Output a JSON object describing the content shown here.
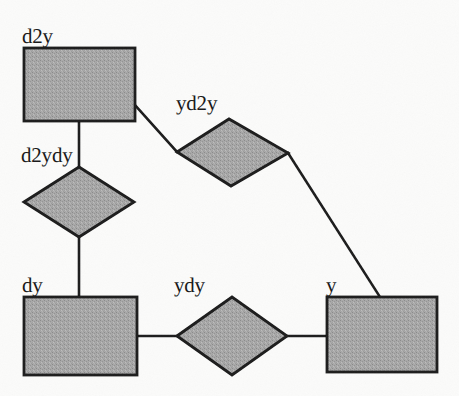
{
  "diagram": {
    "type": "er-diagram",
    "canvas": {
      "width": 459,
      "height": 396
    },
    "style": {
      "fill_color": "#a3a3a3",
      "stroke_color": "#1a1a1a",
      "background_color": "#fbfbfa",
      "label_color": "#171717",
      "stroke_width": 2.6
    },
    "entities": [
      {
        "id": "d2y",
        "label": "d2y",
        "shape": "rectangle",
        "x": 24,
        "y": 48,
        "width": 111,
        "height": 73,
        "label_x": 22,
        "label_y": 26
      },
      {
        "id": "dy",
        "label": "dy",
        "shape": "rectangle",
        "x": 24,
        "y": 297,
        "width": 113,
        "height": 78,
        "label_x": 22,
        "label_y": 275
      },
      {
        "id": "y",
        "label": "y",
        "shape": "rectangle",
        "x": 327,
        "y": 297,
        "width": 110,
        "height": 75,
        "label_x": 326,
        "label_y": 275
      }
    ],
    "relationships": [
      {
        "id": "d2ydy",
        "label": "d2ydy",
        "shape": "diamond",
        "cx": 79,
        "cy": 202,
        "rx": 55,
        "ry": 35,
        "rotated": false,
        "label_x": 21,
        "label_y": 145
      },
      {
        "id": "ydy",
        "label": "ydy",
        "shape": "diamond",
        "cx": 232,
        "cy": 336,
        "rx": 55,
        "ry": 39,
        "rotated": false,
        "label_x": 174,
        "label_y": 275
      },
      {
        "id": "yd2y",
        "label": "yd2y",
        "shape": "diamond",
        "cx": 232,
        "cy": 152,
        "rx": 56,
        "ry": 34,
        "rotated": true,
        "vertices": "177,152 229,119 288,153 231,186",
        "label_x": 176,
        "label_y": 93
      }
    ],
    "edges": [
      {
        "id": "edge-d2y-d2ydy",
        "from": "d2y",
        "to": "d2ydy",
        "points": "79,121 79,168"
      },
      {
        "id": "edge-d2ydy-dy",
        "from": "d2ydy",
        "to": "dy",
        "points": "79,237 79,297"
      },
      {
        "id": "edge-dy-ydy",
        "from": "dy",
        "to": "ydy",
        "points": "137,336 177,336"
      },
      {
        "id": "edge-ydy-y",
        "from": "ydy",
        "to": "y",
        "points": "287,336 327,336"
      },
      {
        "id": "edge-d2y-yd2y",
        "from": "d2y",
        "to": "yd2y",
        "points": "135,105 177,152"
      },
      {
        "id": "edge-yd2y-y",
        "from": "yd2y",
        "to": "y",
        "points": "288,153 380,297"
      }
    ]
  }
}
